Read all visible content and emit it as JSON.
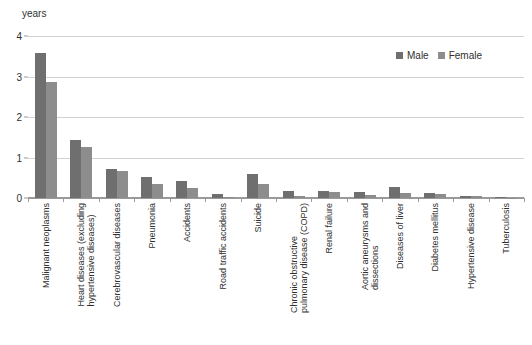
{
  "chart_data": {
    "type": "bar",
    "title": "",
    "subtitle": "",
    "xlabel": "",
    "ylabel": "years",
    "ylim": [
      0,
      4
    ],
    "yticks": [
      0,
      1,
      2,
      3,
      4
    ],
    "ytick_labels": [
      "0",
      "1",
      "2",
      "3",
      "4"
    ],
    "grid": true,
    "grid_axis": "y",
    "legend_position": "top-right",
    "orientation": "vertical",
    "categories": [
      "Malignant neoplasms",
      "Heart diseases (excluding\nhypertensive diseases)",
      "Cerebrovascular diseases",
      "Pneumonia",
      "Accidents",
      "Road traffic accidents",
      "Suicide",
      "Chronic obstructive\npulmonary disease (COPD)",
      "Renal failure",
      "Aortic aneurysms and\ndissections",
      "Diseases of liver",
      "Diabetes mellitus",
      "Hypertensive disease",
      "Tuberculosis"
    ],
    "series": [
      {
        "name": "Male",
        "color": "#6f6f6f",
        "values": [
          3.58,
          1.44,
          0.71,
          0.51,
          0.42,
          0.09,
          0.6,
          0.17,
          0.17,
          0.16,
          0.27,
          0.13,
          0.05,
          0.03
        ]
      },
      {
        "name": "Female",
        "color": "#8d8d8d",
        "values": [
          2.87,
          1.25,
          0.67,
          0.35,
          0.25,
          0.03,
          0.34,
          0.04,
          0.14,
          0.07,
          0.13,
          0.1,
          0.05,
          0.01
        ]
      }
    ]
  },
  "legend": {
    "items": [
      {
        "label": "Male",
        "color": "#6f6f6f"
      },
      {
        "label": "Female",
        "color": "#8d8d8d"
      }
    ]
  },
  "axis": {
    "unit_label": "years"
  }
}
